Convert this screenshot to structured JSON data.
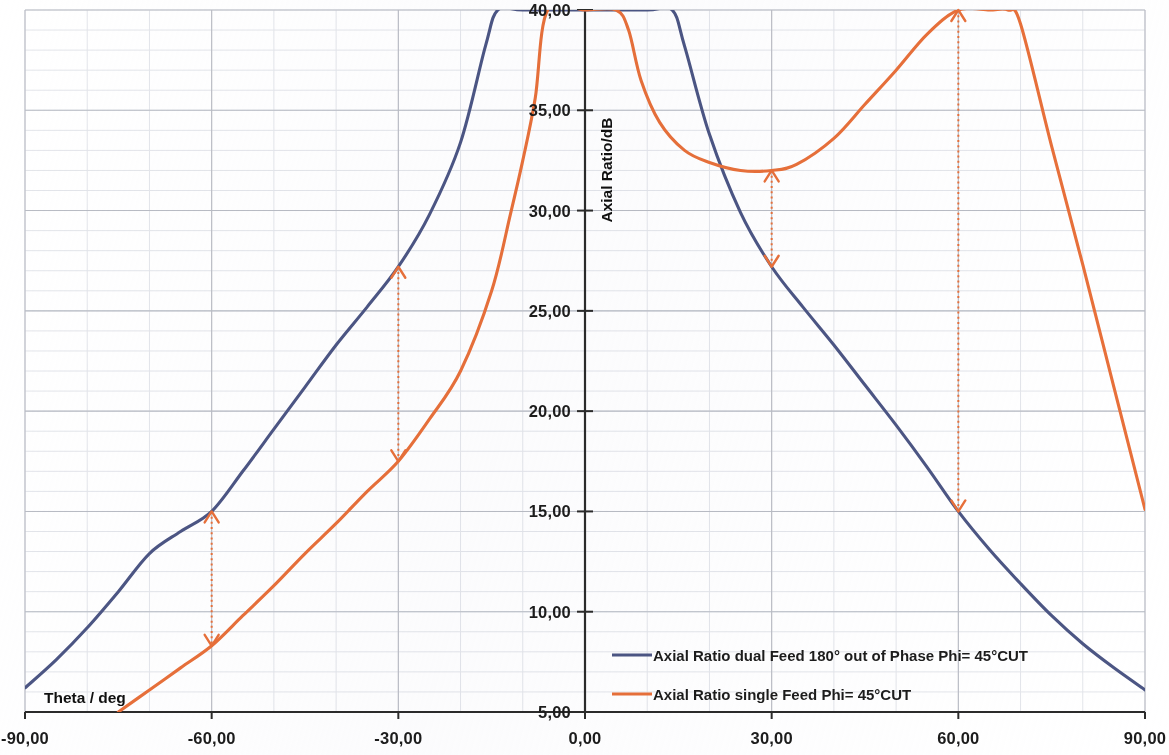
{
  "chart_data": {
    "type": "line",
    "title": "",
    "xlabel": "Theta / deg",
    "ylabel": "Axial Ratio/dB",
    "xlim": [
      -90,
      90
    ],
    "ylim": [
      5,
      40
    ],
    "xticks": [
      -90,
      -60,
      -30,
      0,
      30,
      60,
      90
    ],
    "xticklabels": [
      "-90,00",
      "-60,00",
      "-30,00",
      "0,00",
      "30,00",
      "60,00",
      "90,00"
    ],
    "yticks": [
      5,
      10,
      15,
      20,
      25,
      30,
      35,
      40
    ],
    "yticklabels": [
      "5,00",
      "10,00",
      "15,00",
      "20,00",
      "25,00",
      "30,00",
      "35,00",
      "40,00"
    ],
    "grid": true,
    "minor_grid": true,
    "x_minor_step": 10,
    "y_minor_step": 1,
    "legend_position": "inside-bottom-right",
    "series": [
      {
        "name": "Axial Ratio dual Feed 180° out of Phase Phi= 45°CUT",
        "color": "#4c5684",
        "x": [
          -90,
          -85,
          -80,
          -75,
          -70,
          -65,
          -60,
          -55,
          -50,
          -45,
          -40,
          -35,
          -30,
          -25,
          -20,
          -16,
          -14,
          -10,
          0,
          10,
          14,
          16,
          20,
          25,
          30,
          35,
          40,
          45,
          50,
          55,
          60,
          65,
          70,
          75,
          80,
          85,
          90
        ],
        "y": [
          6.2,
          7.6,
          9.2,
          11.0,
          12.9,
          14.0,
          15.0,
          17.0,
          19.1,
          21.2,
          23.3,
          25.2,
          27.2,
          29.8,
          33.4,
          38.2,
          40.0,
          40.0,
          40.0,
          40.0,
          40.0,
          38.2,
          33.8,
          29.9,
          27.2,
          25.2,
          23.3,
          21.3,
          19.3,
          17.2,
          15.0,
          13.1,
          11.4,
          9.8,
          8.4,
          7.2,
          6.1
        ]
      },
      {
        "name": "Axial Ratio single Feed Phi= 45°CUT",
        "color": "#e8703a",
        "x": [
          -75,
          -70,
          -65,
          -60,
          -55,
          -50,
          -45,
          -40,
          -35,
          -30,
          -25,
          -20,
          -15,
          -12,
          -10,
          -8,
          -6,
          0,
          5,
          7,
          9,
          12,
          16,
          20,
          25,
          30,
          34,
          40,
          45,
          50,
          55,
          60,
          65,
          68,
          70,
          75,
          80,
          85,
          90
        ],
        "y": [
          5.0,
          6.1,
          7.2,
          8.3,
          9.8,
          11.3,
          12.9,
          14.4,
          16.0,
          17.5,
          19.6,
          22.0,
          26.0,
          29.8,
          32.5,
          35.6,
          40.0,
          40.0,
          40.0,
          39.0,
          36.5,
          34.4,
          33.0,
          32.4,
          32.0,
          32.0,
          32.3,
          33.6,
          35.3,
          37.0,
          38.8,
          40.0,
          40.0,
          40.0,
          39.3,
          33.2,
          27.3,
          21.2,
          15.1
        ]
      }
    ],
    "annotations": [
      {
        "name": "delta-arrow-minus60",
        "x": -60,
        "y_top": 15.0,
        "y_bottom": 8.3,
        "color": "#e8703a",
        "style": "dotted-double-arrow"
      },
      {
        "name": "delta-arrow-minus30",
        "x": -30,
        "y_top": 27.2,
        "y_bottom": 17.5,
        "color": "#e8703a",
        "style": "dotted-double-arrow"
      },
      {
        "name": "delta-arrow-plus30",
        "x": 30,
        "y_top": 32.0,
        "y_bottom": 27.2,
        "color": "#e8703a",
        "style": "dotted-double-arrow"
      },
      {
        "name": "delta-arrow-plus60",
        "x": 60,
        "y_top": 40.0,
        "y_bottom": 15.0,
        "color": "#e8703a",
        "style": "dotted-double-arrow"
      }
    ]
  },
  "axes": {
    "x_title": "Theta / deg",
    "y_title": "Axial Ratio/dB"
  },
  "legend": {
    "items": [
      {
        "label": "Axial Ratio dual Feed 180° out of Phase Phi= 45°CUT",
        "color": "#4c5684"
      },
      {
        "label": "Axial Ratio single Feed Phi= 45°CUT",
        "color": "#e8703a"
      }
    ]
  },
  "colors": {
    "series_blue": "#4c5684",
    "series_orange": "#e8703a",
    "axis": "#2b2b2b",
    "major_grid": "#b9bcc4",
    "minor_grid": "#e3e5ea",
    "background": "#ffffff"
  }
}
